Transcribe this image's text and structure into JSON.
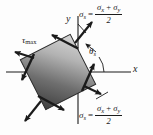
{
  "figure": {
    "background_color": "#fdfdfd",
    "ink_color": "#1b1b1b"
  },
  "axes": {
    "x_label": "x",
    "y_label": "y",
    "origin": [
      78,
      72
    ]
  },
  "element": {
    "description": "square stress element rotated counterclockwise",
    "rotation_deg": -27,
    "fill_dark": "#4a4a4a",
    "fill_light": "#cfcfcf"
  },
  "labels": {
    "tau_max": "τ",
    "tau_max_sub": "max",
    "theta_s": "θ",
    "theta_s_sub": "s"
  },
  "equations": [
    {
      "id": "sigma-s-top",
      "lhs_symbol": "σ",
      "lhs_sub": "s",
      "equals": "=",
      "numerator_first": "σ",
      "numerator_first_sub": "x",
      "numerator_plus": "+",
      "numerator_second": "σ",
      "numerator_second_sub": "y",
      "denominator": "2"
    },
    {
      "id": "sigma-s-bottom",
      "lhs_symbol": "σ",
      "lhs_sub": "s",
      "equals": "=",
      "numerator_first": "σ",
      "numerator_first_sub": "x",
      "numerator_plus": "+",
      "numerator_second": "σ",
      "numerator_second_sub": "y",
      "denominator": "2"
    }
  ],
  "arrows": {
    "normal_stress_count": 4,
    "shear_stress_count": 4,
    "normal_direction": "outward",
    "shear_sense": "counterclockwise"
  }
}
